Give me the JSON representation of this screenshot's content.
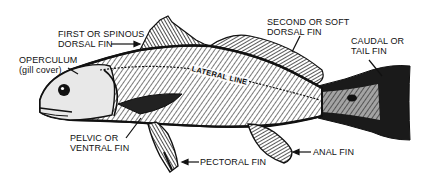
{
  "diagram": {
    "colors": {
      "ink": "#111111",
      "background": "#ffffff",
      "body_shade": "#cfcfcf"
    },
    "labels": {
      "first_dorsal": {
        "line1": "FIRST OR SPINOUS",
        "line2": "DORSAL FIN"
      },
      "operculum": {
        "line1": "OPERCULUM",
        "line2": "(gill cover)"
      },
      "second_dorsal": {
        "line1": "SECOND OR SOFT",
        "line2": "DORSAL FIN"
      },
      "caudal": {
        "line1": "CAUDAL OR",
        "line2": "TAIL FIN"
      },
      "lateral_line": "LATERAL LINE",
      "pelvic": {
        "line1": "PELVIC OR",
        "line2": "VENTRAL FIN"
      },
      "pectoral": "PECTORAL FIN",
      "anal": "ANAL FIN"
    }
  }
}
